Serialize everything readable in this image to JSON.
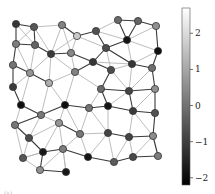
{
  "chart_data": {
    "type": "network-graph",
    "title": "",
    "colormap": "gray",
    "colorbar": {
      "min": -2.2,
      "max": 2.7,
      "ticks": [
        2,
        1,
        0,
        -1,
        -2
      ],
      "tick_labels": [
        "2",
        "1",
        "0",
        "−1",
        "−2"
      ]
    },
    "nodes": [
      {
        "id": 1,
        "x": 16,
        "y": 24,
        "value": -1.3
      },
      {
        "id": 2,
        "x": 34,
        "y": 27,
        "value": -0.6
      },
      {
        "id": 3,
        "x": 62,
        "y": 25,
        "value": 0.3
      },
      {
        "id": 4,
        "x": 77,
        "y": 36,
        "value": 1.8
      },
      {
        "id": 5,
        "x": 96,
        "y": 31,
        "value": -0.7
      },
      {
        "id": 6,
        "x": 118,
        "y": 20,
        "value": -0.2
      },
      {
        "id": 7,
        "x": 138,
        "y": 21,
        "value": -0.3
      },
      {
        "id": 8,
        "x": 156,
        "y": 26,
        "value": 0.6
      },
      {
        "id": 9,
        "x": 127,
        "y": 40,
        "value": -2.0
      },
      {
        "id": 10,
        "x": 158,
        "y": 51,
        "value": -2.1
      },
      {
        "id": 11,
        "x": 106,
        "y": 48,
        "value": -0.8
      },
      {
        "id": 12,
        "x": 16,
        "y": 44,
        "value": 0.2
      },
      {
        "id": 13,
        "x": 35,
        "y": 45,
        "value": -0.3
      },
      {
        "id": 14,
        "x": 51,
        "y": 54,
        "value": -1.2
      },
      {
        "id": 15,
        "x": 71,
        "y": 53,
        "value": 0.4
      },
      {
        "id": 16,
        "x": 93,
        "y": 62,
        "value": -1.3
      },
      {
        "id": 17,
        "x": 111,
        "y": 70,
        "value": -0.8
      },
      {
        "id": 18,
        "x": 132,
        "y": 64,
        "value": -1.3
      },
      {
        "id": 19,
        "x": 152,
        "y": 68,
        "value": -0.1
      },
      {
        "id": 20,
        "x": 13,
        "y": 65,
        "value": 0.0
      },
      {
        "id": 21,
        "x": 30,
        "y": 73,
        "value": 0.7
      },
      {
        "id": 22,
        "x": 49,
        "y": 83,
        "value": 1.2
      },
      {
        "id": 23,
        "x": 75,
        "y": 72,
        "value": 0.3
      },
      {
        "id": 24,
        "x": 13,
        "y": 87,
        "value": -1.2
      },
      {
        "id": 25,
        "x": 101,
        "y": 89,
        "value": -0.2
      },
      {
        "id": 26,
        "x": 129,
        "y": 91,
        "value": -1.0
      },
      {
        "id": 27,
        "x": 155,
        "y": 89,
        "value": 0.6
      },
      {
        "id": 28,
        "x": 21,
        "y": 105,
        "value": -2.1
      },
      {
        "id": 29,
        "x": 41,
        "y": 115,
        "value": 0.1
      },
      {
        "id": 30,
        "x": 65,
        "y": 105,
        "value": -2.1
      },
      {
        "id": 31,
        "x": 89,
        "y": 108,
        "value": 0.0
      },
      {
        "id": 32,
        "x": 108,
        "y": 106,
        "value": -2.0
      },
      {
        "id": 33,
        "x": 133,
        "y": 111,
        "value": -1.2
      },
      {
        "id": 34,
        "x": 155,
        "y": 113,
        "value": -0.7
      },
      {
        "id": 35,
        "x": 15,
        "y": 125,
        "value": 0.1
      },
      {
        "id": 36,
        "x": 59,
        "y": 123,
        "value": 0.7
      },
      {
        "id": 37,
        "x": 29,
        "y": 138,
        "value": -0.8
      },
      {
        "id": 38,
        "x": 43,
        "y": 152,
        "value": -1.9
      },
      {
        "id": 39,
        "x": 63,
        "y": 149,
        "value": 0.2
      },
      {
        "id": 40,
        "x": 80,
        "y": 134,
        "value": 0.1
      },
      {
        "id": 41,
        "x": 108,
        "y": 133,
        "value": -1.0
      },
      {
        "id": 42,
        "x": 129,
        "y": 137,
        "value": -1.0
      },
      {
        "id": 43,
        "x": 153,
        "y": 136,
        "value": 0.5
      },
      {
        "id": 44,
        "x": 23,
        "y": 158,
        "value": -0.6
      },
      {
        "id": 45,
        "x": 40,
        "y": 170,
        "value": 0.6
      },
      {
        "id": 46,
        "x": 66,
        "y": 172,
        "value": -1.9
      },
      {
        "id": 47,
        "x": 88,
        "y": 157,
        "value": -2.0
      },
      {
        "id": 48,
        "x": 114,
        "y": 162,
        "value": -0.5
      },
      {
        "id": 49,
        "x": 133,
        "y": 157,
        "value": -0.9
      },
      {
        "id": 50,
        "x": 158,
        "y": 156,
        "value": 0.2
      }
    ],
    "edges": [
      {
        "s": 1,
        "t": 2,
        "strong": true
      },
      {
        "s": 1,
        "t": 12,
        "strong": true
      },
      {
        "s": 1,
        "t": 13
      },
      {
        "s": 2,
        "t": 12
      },
      {
        "s": 2,
        "t": 13,
        "strong": true
      },
      {
        "s": 2,
        "t": 3
      },
      {
        "s": 2,
        "t": 14
      },
      {
        "s": 3,
        "t": 4,
        "strong": true
      },
      {
        "s": 3,
        "t": 15
      },
      {
        "s": 3,
        "t": 14
      },
      {
        "s": 4,
        "t": 5,
        "strong": true
      },
      {
        "s": 4,
        "t": 15
      },
      {
        "s": 4,
        "t": 11
      },
      {
        "s": 4,
        "t": 14
      },
      {
        "s": 5,
        "t": 6
      },
      {
        "s": 5,
        "t": 11,
        "strong": true
      },
      {
        "s": 5,
        "t": 9
      },
      {
        "s": 6,
        "t": 7,
        "strong": true
      },
      {
        "s": 6,
        "t": 9,
        "strong": true
      },
      {
        "s": 7,
        "t": 8,
        "strong": true
      },
      {
        "s": 7,
        "t": 9,
        "strong": true
      },
      {
        "s": 8,
        "t": 10,
        "strong": true
      },
      {
        "s": 8,
        "t": 9
      },
      {
        "s": 9,
        "t": 11,
        "strong": true
      },
      {
        "s": 9,
        "t": 18
      },
      {
        "s": 9,
        "t": 10
      },
      {
        "s": 10,
        "t": 18
      },
      {
        "s": 10,
        "t": 19,
        "strong": true
      },
      {
        "s": 11,
        "t": 16,
        "strong": true
      },
      {
        "s": 11,
        "t": 17
      },
      {
        "s": 11,
        "t": 18,
        "strong": true
      },
      {
        "s": 12,
        "t": 13,
        "strong": true
      },
      {
        "s": 12,
        "t": 20,
        "strong": true
      },
      {
        "s": 12,
        "t": 21
      },
      {
        "s": 13,
        "t": 14,
        "strong": true
      },
      {
        "s": 13,
        "t": 21
      },
      {
        "s": 14,
        "t": 15,
        "strong": true
      },
      {
        "s": 14,
        "t": 21
      },
      {
        "s": 14,
        "t": 22
      },
      {
        "s": 14,
        "t": 23
      },
      {
        "s": 15,
        "t": 16,
        "strong": true
      },
      {
        "s": 15,
        "t": 23
      },
      {
        "s": 16,
        "t": 23,
        "strong": true
      },
      {
        "s": 16,
        "t": 17,
        "strong": true
      },
      {
        "s": 16,
        "t": 18
      },
      {
        "s": 17,
        "t": 18
      },
      {
        "s": 17,
        "t": 25,
        "strong": true
      },
      {
        "s": 17,
        "t": 26
      },
      {
        "s": 18,
        "t": 19,
        "strong": true
      },
      {
        "s": 18,
        "t": 26
      },
      {
        "s": 19,
        "t": 26
      },
      {
        "s": 19,
        "t": 27,
        "strong": true
      },
      {
        "s": 20,
        "t": 21,
        "strong": true
      },
      {
        "s": 20,
        "t": 24,
        "strong": true
      },
      {
        "s": 21,
        "t": 22,
        "strong": true
      },
      {
        "s": 21,
        "t": 24
      },
      {
        "s": 21,
        "t": 28
      },
      {
        "s": 22,
        "t": 23
      },
      {
        "s": 22,
        "t": 30
      },
      {
        "s": 22,
        "t": 29
      },
      {
        "s": 23,
        "t": 30
      },
      {
        "s": 23,
        "t": 25
      },
      {
        "s": 24,
        "t": 28,
        "strong": true
      },
      {
        "s": 25,
        "t": 26,
        "strong": true
      },
      {
        "s": 25,
        "t": 31
      },
      {
        "s": 25,
        "t": 32,
        "strong": true
      },
      {
        "s": 26,
        "t": 27,
        "strong": true
      },
      {
        "s": 26,
        "t": 33,
        "strong": true
      },
      {
        "s": 26,
        "t": 32
      },
      {
        "s": 27,
        "t": 34,
        "strong": true
      },
      {
        "s": 27,
        "t": 33
      },
      {
        "s": 28,
        "t": 29,
        "strong": true
      },
      {
        "s": 28,
        "t": 35
      },
      {
        "s": 29,
        "t": 30,
        "strong": true
      },
      {
        "s": 29,
        "t": 35,
        "strong": true
      },
      {
        "s": 29,
        "t": 36
      },
      {
        "s": 29,
        "t": 37
      },
      {
        "s": 30,
        "t": 31,
        "strong": true
      },
      {
        "s": 30,
        "t": 36
      },
      {
        "s": 30,
        "t": 40
      },
      {
        "s": 31,
        "t": 32,
        "strong": true
      },
      {
        "s": 31,
        "t": 40
      },
      {
        "s": 31,
        "t": 41
      },
      {
        "s": 32,
        "t": 33,
        "strong": true
      },
      {
        "s": 32,
        "t": 41
      },
      {
        "s": 33,
        "t": 34,
        "strong": true
      },
      {
        "s": 33,
        "t": 42
      },
      {
        "s": 33,
        "t": 43
      },
      {
        "s": 34,
        "t": 43,
        "strong": true
      },
      {
        "s": 35,
        "t": 37,
        "strong": true
      },
      {
        "s": 35,
        "t": 44
      },
      {
        "s": 36,
        "t": 37
      },
      {
        "s": 36,
        "t": 38
      },
      {
        "s": 36,
        "t": 40,
        "strong": true
      },
      {
        "s": 36,
        "t": 39
      },
      {
        "s": 37,
        "t": 38,
        "strong": true
      },
      {
        "s": 37,
        "t": 44
      },
      {
        "s": 38,
        "t": 39,
        "strong": true
      },
      {
        "s": 38,
        "t": 45,
        "strong": true
      },
      {
        "s": 38,
        "t": 44
      },
      {
        "s": 39,
        "t": 40
      },
      {
        "s": 39,
        "t": 46
      },
      {
        "s": 39,
        "t": 47,
        "strong": true
      },
      {
        "s": 39,
        "t": 45
      },
      {
        "s": 40,
        "t": 41
      },
      {
        "s": 40,
        "t": 47
      },
      {
        "s": 41,
        "t": 42,
        "strong": true
      },
      {
        "s": 41,
        "t": 47
      },
      {
        "s": 41,
        "t": 48
      },
      {
        "s": 42,
        "t": 43,
        "strong": true
      },
      {
        "s": 42,
        "t": 48
      },
      {
        "s": 42,
        "t": 49
      },
      {
        "s": 43,
        "t": 50,
        "strong": true
      },
      {
        "s": 43,
        "t": 49
      },
      {
        "s": 44,
        "t": 45
      },
      {
        "s": 44,
        "t": 38
      },
      {
        "s": 45,
        "t": 46,
        "strong": true
      },
      {
        "s": 46,
        "t": 39
      },
      {
        "s": 47,
        "t": 48,
        "strong": true
      },
      {
        "s": 48,
        "t": 49,
        "strong": true
      },
      {
        "s": 49,
        "t": 50,
        "strong": true
      }
    ],
    "xlabel": "",
    "ylabel": ""
  },
  "caption": "(a) ..."
}
